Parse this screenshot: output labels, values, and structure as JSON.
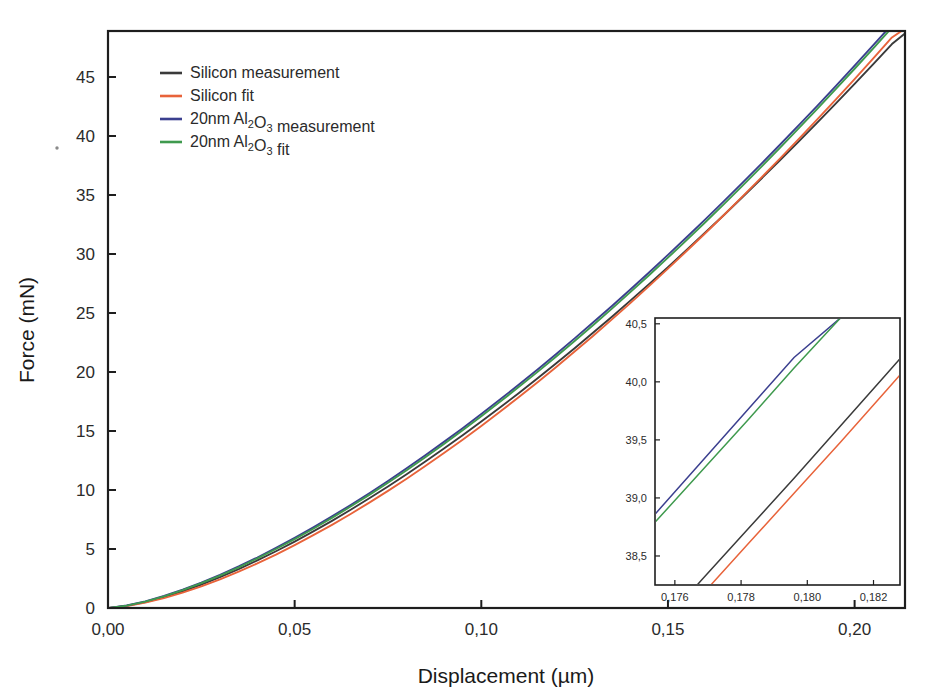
{
  "axes": {
    "xlabel": "Displacement (µm)",
    "ylabel": "Force (mN)",
    "x_ticks": [
      "0,00",
      "0,05",
      "0,10",
      "0,15",
      "0,20"
    ],
    "y_ticks": [
      "0",
      "5",
      "10",
      "15",
      "20",
      "25",
      "30",
      "35",
      "40",
      "45"
    ]
  },
  "legend": [
    {
      "label": "Silicon measurement",
      "color": "#3a3a3a",
      "name": "silicon-measurement"
    },
    {
      "label": "Silicon fit",
      "color": "#e8633a",
      "name": "silicon-fit"
    },
    {
      "label": "20nm Al2O3 measurement",
      "color": "#3b3f8f",
      "name": "alumina-measurement",
      "rich": [
        {
          "t": "20nm Al"
        },
        {
          "t": "2",
          "sub": true
        },
        {
          "t": "O"
        },
        {
          "t": "3",
          "sub": true
        },
        {
          "t": " measurement"
        }
      ]
    },
    {
      "label": "20nm Al2O3 fit",
      "color": "#3f9a4e",
      "name": "alumina-fit",
      "rich": [
        {
          "t": "20nm Al"
        },
        {
          "t": "2",
          "sub": true
        },
        {
          "t": "O"
        },
        {
          "t": "3",
          "sub": true
        },
        {
          "t": " fit"
        }
      ]
    }
  ],
  "inset": {
    "x_ticks": [
      "0,176",
      "0,178",
      "0,180",
      "0,182"
    ],
    "y_ticks": [
      "38,5",
      "39,0",
      "39,5",
      "40,0",
      "40,5"
    ]
  },
  "chart_data": {
    "type": "line",
    "title": "",
    "xlabel": "Displacement (µm)",
    "ylabel": "Force (mN)",
    "xlim": [
      0.0,
      0.2135
    ],
    "ylim": [
      0.0,
      48.9
    ],
    "xticks": [
      0.0,
      0.05,
      0.1,
      0.15,
      0.2
    ],
    "yticks": [
      0,
      5,
      10,
      15,
      20,
      25,
      30,
      35,
      40,
      45
    ],
    "grid": false,
    "legend_position": "upper-left",
    "x": [
      0.0,
      0.005,
      0.01,
      0.015,
      0.02,
      0.025,
      0.03,
      0.035,
      0.04,
      0.045,
      0.05,
      0.055,
      0.06,
      0.065,
      0.07,
      0.075,
      0.08,
      0.085,
      0.09,
      0.095,
      0.1,
      0.105,
      0.11,
      0.115,
      0.12,
      0.125,
      0.13,
      0.135,
      0.14,
      0.145,
      0.15,
      0.155,
      0.16,
      0.165,
      0.17,
      0.175,
      0.18,
      0.185,
      0.19,
      0.195,
      0.2,
      0.205,
      0.21,
      0.2135
    ],
    "series": [
      {
        "name": "Silicon measurement",
        "color": "#3a3a3a",
        "values": [
          0.0,
          0.18,
          0.5,
          0.92,
          1.42,
          1.99,
          2.62,
          3.3,
          4.03,
          4.81,
          5.63,
          6.49,
          7.39,
          8.33,
          9.3,
          10.3,
          11.34,
          12.41,
          13.51,
          14.64,
          15.8,
          16.99,
          18.2,
          19.45,
          20.72,
          22.02,
          23.34,
          24.69,
          26.07,
          27.47,
          28.89,
          30.34,
          31.82,
          33.31,
          34.83,
          36.38,
          37.94,
          39.53,
          41.14,
          42.77,
          44.42,
          46.1,
          47.79,
          48.7
        ]
      },
      {
        "name": "Silicon fit",
        "color": "#e8633a",
        "values": [
          0.0,
          0.16,
          0.45,
          0.84,
          1.3,
          1.83,
          2.43,
          3.08,
          3.78,
          4.53,
          5.33,
          6.17,
          7.05,
          7.97,
          8.93,
          9.93,
          10.96,
          12.03,
          13.13,
          14.26,
          15.43,
          16.63,
          17.86,
          19.12,
          20.41,
          21.73,
          23.08,
          24.46,
          25.86,
          27.3,
          28.76,
          30.25,
          31.76,
          33.31,
          34.88,
          36.47,
          38.09,
          39.74,
          41.41,
          43.11,
          44.83,
          46.58,
          48.35,
          49.1
        ]
      },
      {
        "name": "20nm Al2O3 measurement",
        "color": "#3b3f8f",
        "values": [
          0.0,
          0.21,
          0.56,
          1.02,
          1.55,
          2.15,
          2.81,
          3.52,
          4.28,
          5.09,
          5.94,
          6.83,
          7.76,
          8.73,
          9.73,
          10.77,
          11.84,
          12.94,
          14.08,
          15.24,
          16.44,
          17.66,
          18.92,
          20.2,
          21.51,
          22.85,
          24.21,
          25.6,
          27.02,
          28.46,
          29.93,
          31.42,
          32.94,
          34.48,
          36.05,
          37.64,
          39.26,
          40.9,
          42.56,
          44.25,
          45.96,
          47.7,
          49.45,
          50.4
        ]
      },
      {
        "name": "20nm Al2O3 fit",
        "color": "#3f9a4e",
        "values": [
          0.0,
          0.2,
          0.54,
          0.99,
          1.51,
          2.1,
          2.75,
          3.45,
          4.2,
          5.0,
          5.84,
          6.72,
          7.64,
          8.6,
          9.59,
          10.62,
          11.68,
          12.78,
          13.9,
          15.06,
          16.25,
          17.47,
          18.72,
          19.99,
          21.3,
          22.63,
          23.99,
          25.37,
          26.79,
          28.22,
          29.69,
          31.18,
          32.69,
          34.23,
          35.8,
          37.39,
          39.0,
          40.64,
          42.3,
          43.99,
          45.7,
          47.43,
          49.19,
          50.13
        ]
      }
    ],
    "inset": {
      "type": "line",
      "xlim": [
        0.1754,
        0.1828
      ],
      "ylim": [
        38.25,
        40.55
      ],
      "xticks": [
        0.176,
        0.178,
        0.18,
        0.182
      ],
      "yticks": [
        38.5,
        39.0,
        39.5,
        40.0,
        40.5
      ],
      "x": [
        0.1754,
        0.1768,
        0.1782,
        0.1796,
        0.181,
        0.1824,
        0.1828
      ],
      "series": [
        {
          "name": "Silicon measurement",
          "color": "#3a3a3a",
          "values": [
            37.85,
            38.29,
            38.73,
            39.17,
            39.62,
            40.07,
            40.2
          ]
        },
        {
          "name": "Silicon fit",
          "color": "#e8633a",
          "values": [
            37.72,
            38.16,
            38.6,
            39.04,
            39.48,
            39.93,
            40.06
          ]
        },
        {
          "name": "20nm Al2O3 measurement",
          "color": "#3b3f8f",
          "values": [
            38.86,
            39.31,
            39.76,
            40.21,
            40.55,
            40.55,
            40.55
          ]
        },
        {
          "name": "20nm Al2O3 fit",
          "color": "#3f9a4e",
          "values": [
            38.79,
            39.23,
            39.67,
            40.12,
            40.55,
            40.55,
            40.55
          ]
        }
      ]
    }
  }
}
